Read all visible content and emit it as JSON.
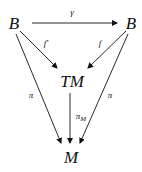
{
  "diagram": {
    "type": "commutative-diagram",
    "nodes": {
      "b_left": "B",
      "b_right": "B",
      "tm": "TM",
      "m": "M"
    },
    "arrows": {
      "gamma": {
        "label": "γ",
        "from": "B",
        "to": "B"
      },
      "f_prime": {
        "label": "f'",
        "from": "B",
        "to": "TM"
      },
      "f": {
        "label": "f",
        "from": "B",
        "to": "TM"
      },
      "pi_left": {
        "label": "π",
        "from": "B",
        "to": "M"
      },
      "pi_right": {
        "label": "π",
        "from": "B",
        "to": "M"
      },
      "pi_m": {
        "label": "π",
        "sub": "M",
        "from": "TM",
        "to": "M"
      }
    }
  }
}
